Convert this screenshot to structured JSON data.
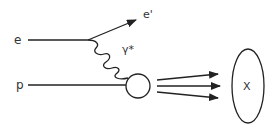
{
  "diagram": {
    "labels": {
      "incoming_electron": "e",
      "outgoing_electron": "e'",
      "virtual_photon": "γ*",
      "proton": "p",
      "hadronic_final_state": "X"
    },
    "colors": {
      "stroke": "#222222",
      "text": "#333333",
      "background": "#ffffff"
    }
  }
}
